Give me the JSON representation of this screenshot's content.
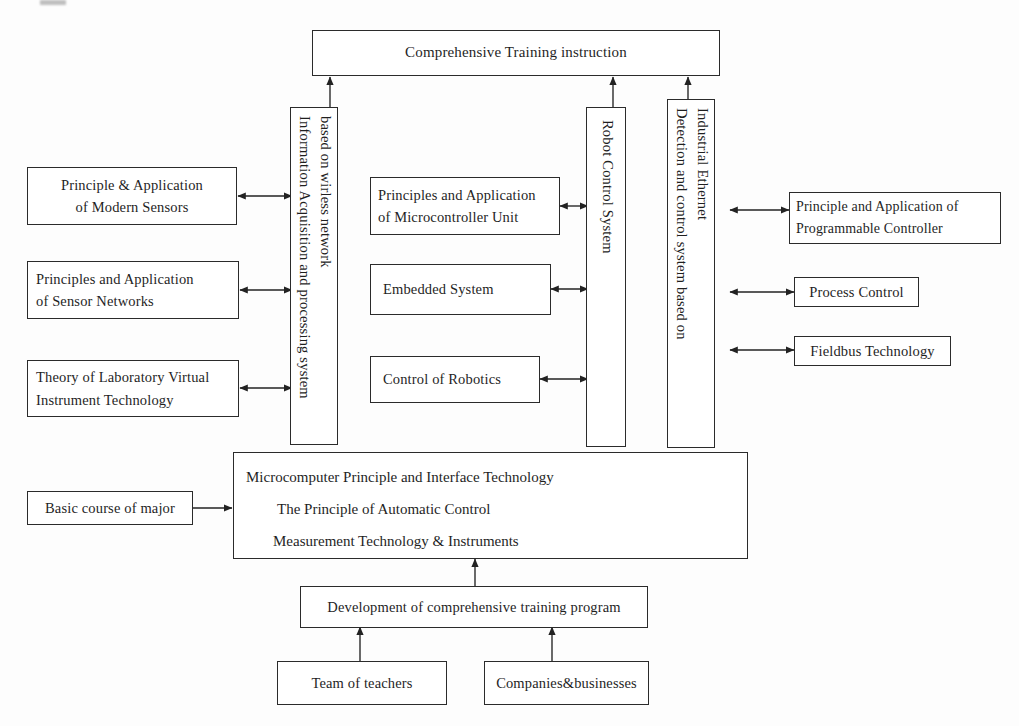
{
  "diagram": {
    "title": "Comprehensive Training instruction",
    "top_box": {
      "label": "Comprehensive Training  instruction"
    },
    "vertical_columns": [
      {
        "name": "information-acquisition-column",
        "line1": "Information Acquisition and processing system",
        "line2": "based on wirless network"
      },
      {
        "name": "robot-control-column",
        "line1": "Robot Control System"
      },
      {
        "name": "industrial-ethernet-column",
        "line1": "Detection and control system based on",
        "line2": "Industrial Ethernet"
      }
    ],
    "left_boxes": [
      {
        "name": "modern-sensors-box",
        "line1": "Principle & Application",
        "line2": "of Modern Sensors"
      },
      {
        "name": "sensor-networks-box",
        "line1": "Principles and Application",
        "line2": "of Sensor Networks"
      },
      {
        "name": "virtual-instrument-box",
        "line1": "Theory of Laboratory Virtual",
        "line2": "Instrument Technology"
      }
    ],
    "middle_boxes": [
      {
        "name": "microcontroller-box",
        "line1": "Principles and Application",
        "line2": "of Microcontroller Unit"
      },
      {
        "name": "embedded-system-box",
        "line1": "Embedded System",
        "line2": ""
      },
      {
        "name": "control-of-robotics-box",
        "line1": "Control of Robotics",
        "line2": ""
      }
    ],
    "right_boxes": [
      {
        "name": "programmable-controller-box",
        "line1": "Principle and Application of",
        "line2": "Programmable Controller"
      },
      {
        "name": "process-control-box",
        "line1": "Process Control",
        "line2": ""
      },
      {
        "name": "fieldbus-technology-box",
        "line1": "Fieldbus Technology",
        "line2": ""
      }
    ],
    "basic_course_box": {
      "label": "Basic course of major"
    },
    "core_courses_box": {
      "line1": "Microcomputer Principle and Interface Technology",
      "line2": "The Principle of Automatic Control",
      "line3": "Measurement Technology & Instruments"
    },
    "development_box": {
      "label": "Development of comprehensive training program"
    },
    "source_boxes": [
      {
        "name": "team-of-teachers-box",
        "label": "Team of teachers"
      },
      {
        "name": "companies-businesses-box",
        "label": "Companies&businesses"
      }
    ],
    "colors": {
      "stroke": "#2b2b2b",
      "text": "#1f1f1f",
      "background": "#fdfdfd"
    }
  }
}
